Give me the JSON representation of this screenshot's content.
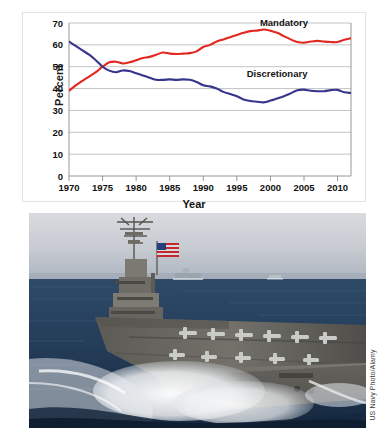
{
  "chart_data": {
    "type": "line",
    "title": "",
    "xlabel": "Year",
    "ylabel": "Percent",
    "xlim": [
      1970,
      2012
    ],
    "ylim": [
      0,
      70
    ],
    "grid": true,
    "legend_position": "inline-annotations",
    "xticks": [
      "1970",
      "1975",
      "1980",
      "1985",
      "1990",
      "1995",
      "2000",
      "2005",
      "2010"
    ],
    "yticks": [
      "0",
      "10",
      "20",
      "30",
      "40",
      "50",
      "60",
      "70"
    ],
    "x": [
      1970,
      1971,
      1972,
      1973,
      1974,
      1975,
      1976,
      1977,
      1978,
      1979,
      1980,
      1981,
      1982,
      1983,
      1984,
      1985,
      1986,
      1987,
      1988,
      1989,
      1990,
      1991,
      1992,
      1993,
      1994,
      1995,
      1996,
      1997,
      1998,
      1999,
      2000,
      2001,
      2002,
      2003,
      2004,
      2005,
      2006,
      2007,
      2008,
      2009,
      2010,
      2011,
      2012
    ],
    "series": [
      {
        "name": "Mandatory",
        "color": "#E2271F",
        "values": [
          39.0,
          41.5,
          43.5,
          45.5,
          47.5,
          50.0,
          52.0,
          52.3,
          51.5,
          52.0,
          53.0,
          54.0,
          54.5,
          55.5,
          56.5,
          56.0,
          55.8,
          56.0,
          56.2,
          57.0,
          59.0,
          60.0,
          61.5,
          62.5,
          63.5,
          64.5,
          65.5,
          66.3,
          66.5,
          67.0,
          66.5,
          65.5,
          64.0,
          62.5,
          61.3,
          61.0,
          61.5,
          61.8,
          61.5,
          61.3,
          61.3,
          62.3,
          63.0
        ]
      },
      {
        "name": "Discretionary",
        "color": "#36348C",
        "values": [
          61.5,
          59.5,
          57.5,
          55.5,
          53.0,
          50.0,
          48.2,
          47.5,
          48.3,
          48.0,
          47.0,
          46.0,
          45.0,
          44.0,
          44.0,
          44.2,
          44.0,
          44.2,
          44.0,
          43.0,
          41.5,
          41.0,
          40.0,
          38.5,
          37.5,
          36.5,
          35.0,
          34.3,
          34.0,
          33.7,
          34.5,
          35.5,
          36.5,
          37.8,
          39.2,
          39.5,
          39.0,
          38.8,
          38.8,
          39.3,
          39.4,
          38.3,
          38.0
        ]
      }
    ],
    "annotations": [
      {
        "text": "Mandatory",
        "x": 2002,
        "y": 68.5
      },
      {
        "text": "Discretionary",
        "x": 2001,
        "y": 45.5
      }
    ]
  },
  "photo": {
    "name": "aircraft-carrier-photo",
    "alt": "US Navy aircraft carrier underway at sea with flag flying",
    "credit": "US Navy Photo/Alamy",
    "colors": {
      "sky": "#c9cdd4",
      "sea": "#1f3550",
      "wake": "#e8eaee",
      "ship": "#6b6a62"
    }
  }
}
